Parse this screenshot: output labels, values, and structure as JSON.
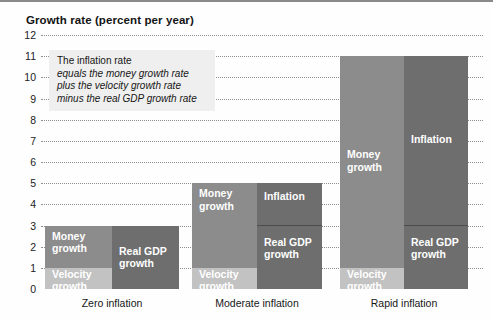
{
  "figure": {
    "title": "Growth rate (percent per year)",
    "background": "#fefefe"
  },
  "annotation": {
    "line1": "The inflation rate",
    "line2": "equals the money growth rate",
    "line3": "plus the velocity growth rate",
    "line4": "minus the real GDP growth rate"
  },
  "colors": {
    "money_growth": "#8c8c8c",
    "velocity_growth": "#c2c2c2",
    "real_gdp_growth": "#6e6e6e",
    "inflation": "#6e6e6e",
    "gridline": "#8d8d8d",
    "text": "#161616"
  },
  "labels": {
    "money_growth_l1": "Money",
    "money_growth_l2": "growth",
    "velocity_growth_l1": "Velocity",
    "velocity_growth_l2": "growth",
    "real_gdp_l1": "Real GDP",
    "real_gdp_l2": "growth",
    "inflation": "Inflation"
  },
  "chart_data": {
    "type": "bar",
    "title": "Growth rate (percent per year)",
    "xlabel": "",
    "ylabel": "Growth rate (percent per year)",
    "ylim": [
      0,
      12
    ],
    "yticks": [
      0,
      1,
      2,
      3,
      4,
      5,
      6,
      7,
      8,
      9,
      10,
      11,
      12
    ],
    "ytick_labels": [
      "0",
      "1",
      "2",
      "3",
      "4",
      "5",
      "6",
      "7",
      "8",
      "9",
      "10",
      "11",
      "12"
    ],
    "grid": true,
    "legend": "none",
    "stacked": true,
    "categories": [
      "Zero inflation",
      "Moderate inflation",
      "Rapid inflation"
    ],
    "column_groups": [
      "sources",
      "uses"
    ],
    "series": [
      {
        "name": "Velocity growth",
        "group": "sources",
        "values": [
          1,
          1,
          1
        ]
      },
      {
        "name": "Money growth",
        "group": "sources",
        "values": [
          2,
          4,
          10
        ]
      },
      {
        "name": "Real GDP growth",
        "group": "uses",
        "values": [
          3,
          3,
          3
        ]
      },
      {
        "name": "Inflation",
        "group": "uses",
        "values": [
          0,
          2,
          8
        ]
      }
    ],
    "totals": {
      "sources": [
        3,
        5,
        11
      ],
      "uses": [
        3,
        5,
        11
      ]
    }
  }
}
